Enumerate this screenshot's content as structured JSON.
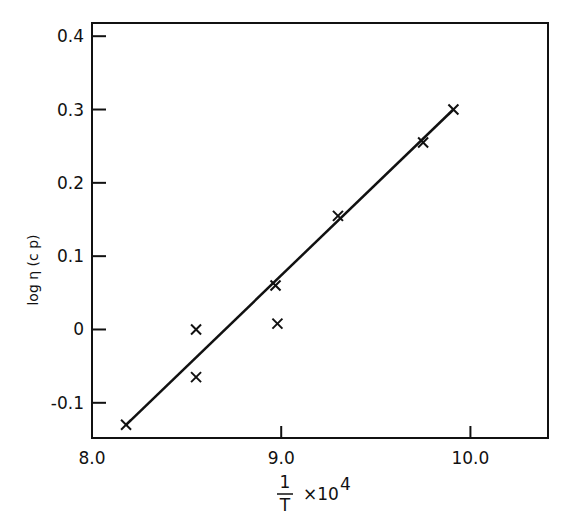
{
  "chart_data": {
    "type": "scatter",
    "title": "",
    "xlabel": "1/T × 10^4",
    "xlabel_parts": {
      "numerator": "1",
      "denominator": "T",
      "suffix": "×10",
      "exponent": "4"
    },
    "ylabel": "log η (c p)",
    "xlim": [
      8.0,
      10.41
    ],
    "ylim": [
      -0.148,
      0.418
    ],
    "grid": false,
    "legend": null,
    "x_ticks": [
      {
        "value": 8.0,
        "label": "8.0"
      },
      {
        "value": 9.0,
        "label": "9.0"
      },
      {
        "value": 10.0,
        "label": "10.0"
      }
    ],
    "y_ticks": [
      {
        "value": 0.4,
        "label": "0.4"
      },
      {
        "value": 0.3,
        "label": "0.3"
      },
      {
        "value": 0.2,
        "label": "0.2"
      },
      {
        "value": 0.1,
        "label": "0.1"
      },
      {
        "value": 0.0,
        "label": "0"
      },
      {
        "value": -0.1,
        "label": "-0.1"
      }
    ],
    "series": [
      {
        "name": "measured",
        "marker": "x",
        "x": [
          8.18,
          8.55,
          8.55,
          8.97,
          8.98,
          9.3,
          9.75,
          9.91
        ],
        "y": [
          -0.13,
          0.0,
          -0.065,
          0.06,
          0.008,
          0.155,
          0.255,
          0.3
        ]
      },
      {
        "name": "fit",
        "style": "line",
        "x": [
          8.18,
          9.91
        ],
        "y": [
          -0.13,
          0.3
        ]
      }
    ]
  }
}
